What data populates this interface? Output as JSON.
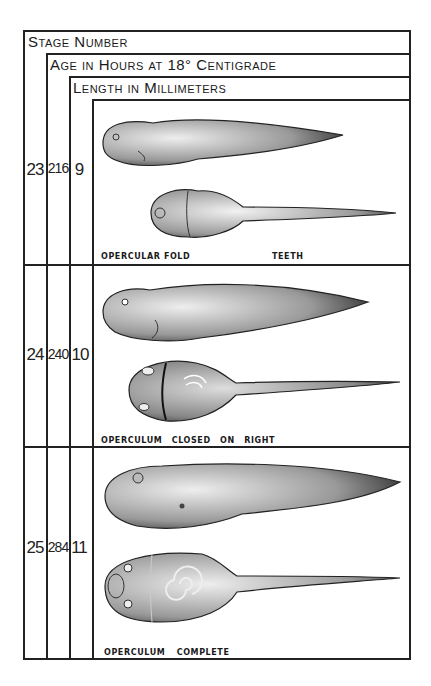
{
  "table": {
    "headers": {
      "stage": "Stage Number",
      "age": "Age in Hours at 18° Centigrade",
      "length": "Length in Millimeters"
    },
    "rows": [
      {
        "stage": "23",
        "age_hours": "216",
        "length_mm": "9",
        "captions": [
          "OPERCULAR FOLD",
          "TEETH"
        ],
        "illustrations": [
          "tadpole-lateral-view",
          "tadpole-ventral-view"
        ]
      },
      {
        "stage": "24",
        "age_hours": "240",
        "length_mm": "10",
        "captions": [
          "OPERCULUM CLOSED ON RIGHT"
        ],
        "illustrations": [
          "tadpole-lateral-view",
          "tadpole-ventral-view"
        ]
      },
      {
        "stage": "25",
        "age_hours": "284",
        "length_mm": "11",
        "captions": [
          "OPERCULUM COMPLETE"
        ],
        "illustrations": [
          "tadpole-lateral-view",
          "tadpole-ventral-view"
        ]
      }
    ]
  },
  "colors": {
    "ink": "#222222",
    "paper": "#ffffff",
    "stipple": "#555555"
  }
}
